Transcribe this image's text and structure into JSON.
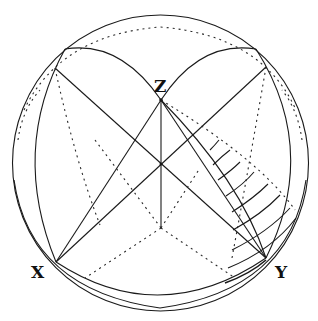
{
  "diagram": {
    "type": "spherical-projection",
    "labels": {
      "x": "X",
      "y": "Y",
      "z": "Z"
    },
    "colors": {
      "line": "#1a1a1a",
      "background": "#ffffff"
    }
  }
}
